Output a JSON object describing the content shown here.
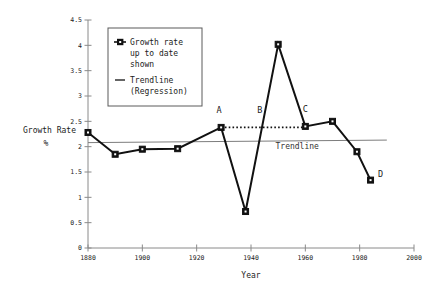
{
  "chart_data": {
    "type": "line",
    "title": "",
    "xlabel": "Year",
    "ylabel": "Growth Rate",
    "ylabel_unit": "%",
    "xlim": [
      1880,
      2000
    ],
    "ylim": [
      0,
      4.5
    ],
    "xticks": [
      "1880",
      "1900",
      "1920",
      "1940",
      "1960",
      "1980",
      "2000"
    ],
    "xtick_values": [
      1880,
      1900,
      1920,
      1940,
      1960,
      1980,
      2000
    ],
    "yticks": [
      "0",
      "0.5",
      "1",
      "1.5",
      "2",
      "2.5",
      "3",
      "3.5",
      "4",
      "4.5"
    ],
    "ytick_values": [
      0,
      0.5,
      1,
      1.5,
      2,
      2.5,
      3,
      3.5,
      4,
      4.5
    ],
    "grid": false,
    "legend_position": "upper-left",
    "series": [
      {
        "name": "Growth rate up to date shown",
        "marker": "square-dot",
        "x": [
          1880,
          1890,
          1900,
          1913,
          1929,
          1938,
          1950,
          1960,
          1970,
          1979,
          1984
        ],
        "values": [
          2.28,
          1.85,
          1.95,
          1.96,
          2.38,
          0.72,
          4.02,
          2.4,
          2.5,
          1.9,
          1.34
        ]
      },
      {
        "name": "Trendline (Regression)",
        "marker": "none",
        "x": [
          1880,
          1990
        ],
        "values": [
          2.08,
          2.13
        ]
      }
    ],
    "reference_line": {
      "label": "dotted-level-line",
      "y": 2.38,
      "x_start": 1929,
      "x_end": 1960,
      "style": "dotted"
    },
    "annotations": [
      {
        "text": "A",
        "x": 1929,
        "y": 2.38,
        "dx": -2,
        "dy": 14
      },
      {
        "text": "B",
        "x": 1944,
        "y": 2.38,
        "dx": -2,
        "dy": 14
      },
      {
        "text": "C",
        "x": 1960,
        "y": 2.4,
        "dx": 0,
        "dy": 14
      },
      {
        "text": "D",
        "x": 1984,
        "y": 1.34,
        "dx": 10,
        "dy": 3
      },
      {
        "text": "Trendline",
        "x": 1957,
        "y": 1.95,
        "dx": 0,
        "dy": 0
      }
    ]
  },
  "legend": {
    "entries": [
      {
        "marker": "square-dot-marker",
        "lines": [
          "Growth rate",
          "up to date",
          "shown"
        ]
      },
      {
        "marker": "line-marker",
        "lines": [
          "Trendline",
          "(Regression)"
        ]
      }
    ]
  },
  "axis": {
    "y_title_line1": "Growth Rate",
    "y_title_line2": "%",
    "x_title": "Year"
  }
}
